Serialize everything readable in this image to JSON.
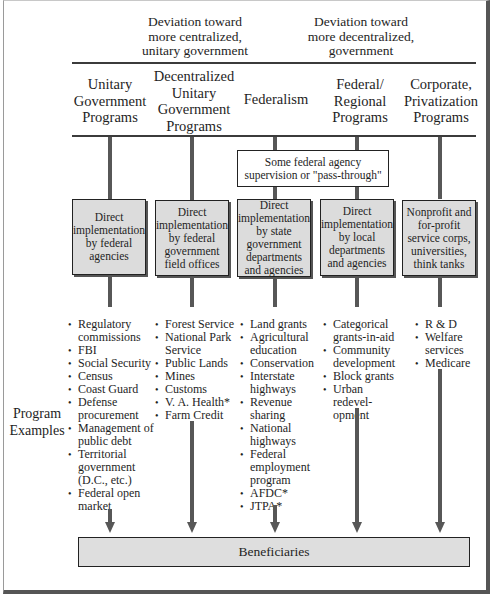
{
  "header": {
    "left_deviation": [
      "Deviation toward",
      "more centralized,",
      "unitary government"
    ],
    "right_deviation": [
      "Deviation toward",
      "more decentralized,",
      "government"
    ]
  },
  "columns": [
    {
      "title": [
        "Unitary",
        "Government",
        "Programs"
      ],
      "box": "Direct implementation by federal agencies",
      "examples": [
        "Regulatory commissions",
        "FBI",
        "Social Security",
        "Census",
        "Coast Guard",
        "Defense procurement",
        "Management of public debt",
        "Territorial government (D.C., etc.)",
        "Federal open market"
      ]
    },
    {
      "title": [
        "Decentralized",
        "Unitary",
        "Government",
        "Programs"
      ],
      "box": "Direct implementation by federal government field offices",
      "examples": [
        "Forest Service",
        "National Park Service",
        "Public Lands",
        "Mines",
        "Customs",
        "V. A. Health*",
        "Farm Credit"
      ]
    },
    {
      "title": [
        "Federalism"
      ],
      "box": "Direct implementation by state government departments and agencies",
      "examples": [
        "Land grants",
        "Agricultural education",
        "Conservation",
        "Interstate highways",
        "Revenue sharing",
        "National highways",
        "Federal employment program",
        "AFDC*",
        "JTPA*"
      ]
    },
    {
      "title": [
        "Federal/",
        "Regional",
        "Programs"
      ],
      "box": "Direct implementation by local departments and agencies",
      "examples": [
        "Categorical grants-in-aid",
        "Community development",
        "Block grants",
        "Urban redevel-opment"
      ]
    },
    {
      "title": [
        "Corporate,",
        "Privatization",
        "Programs"
      ],
      "box": "Nonprofit and for-profit service corps, universities, think tanks",
      "examples": [
        "R & D",
        "Welfare services",
        "Medicare"
      ]
    }
  ],
  "pass_through": "Some federal agency supervision or \"pass-through\"",
  "side_label": "Program Examples",
  "beneficiaries": "Beneficiaries",
  "colors": {
    "box_fill": "#dcdcdc",
    "line": "#575757",
    "border": "#222222"
  }
}
